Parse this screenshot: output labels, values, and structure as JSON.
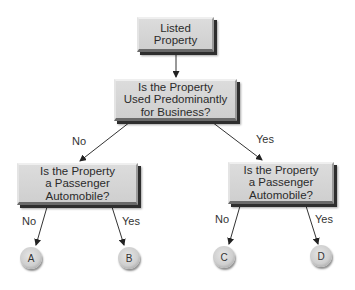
{
  "diagram": {
    "type": "decision-tree",
    "nodes": {
      "root": {
        "lines": [
          "Listed",
          "Property"
        ]
      },
      "question_business": {
        "lines": [
          "Is the Property",
          "Used Predominantly",
          "for Business?"
        ]
      },
      "question_auto_left": {
        "lines": [
          "Is the Property",
          "a Passenger",
          "Automobile?"
        ]
      },
      "question_auto_right": {
        "lines": [
          "Is the Property",
          "a Passenger",
          "Automobile?"
        ]
      }
    },
    "edge_labels": {
      "business_no": "No",
      "business_yes": "Yes",
      "left_no": "No",
      "left_yes": "Yes",
      "right_no": "No",
      "right_yes": "Yes"
    },
    "outcomes": {
      "a": "A",
      "b": "B",
      "c": "C",
      "d": "D"
    },
    "colors": {
      "box_fill": "#d4d4d4",
      "box_shadow": "#2e2e2e",
      "line": "#333333",
      "background": "#ffffff"
    }
  }
}
